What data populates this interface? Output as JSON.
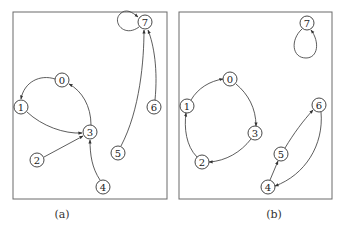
{
  "figure": {
    "node_radius": 7,
    "colors": {
      "stroke": "#333333",
      "frame": "#6a6a6a",
      "node_fill": "#ffffff"
    },
    "panels": [
      {
        "id": "a",
        "caption": "(a)",
        "caption_pos": [
          62,
          218
        ],
        "frame": {
          "x": 13,
          "y": 12,
          "w": 154,
          "h": 187
        },
        "nodes": [
          {
            "id": "0",
            "label": "0",
            "x": 62,
            "y": 80
          },
          {
            "id": "1",
            "label": "1",
            "x": 21,
            "y": 107
          },
          {
            "id": "2",
            "label": "2",
            "x": 37,
            "y": 160
          },
          {
            "id": "3",
            "label": "3",
            "x": 90,
            "y": 132
          },
          {
            "id": "4",
            "label": "4",
            "x": 103,
            "y": 187
          },
          {
            "id": "5",
            "label": "5",
            "x": 118,
            "y": 153
          },
          {
            "id": "6",
            "label": "6",
            "x": 154,
            "y": 107
          },
          {
            "id": "7",
            "label": "7",
            "x": 145,
            "y": 22
          }
        ],
        "edges": [
          {
            "from": "0",
            "to": "1",
            "path": "M55,79 C40,74 24,82 21,99"
          },
          {
            "from": "1",
            "to": "3",
            "path": "M27,112 C42,126 64,134 82,133"
          },
          {
            "from": "3",
            "to": "0",
            "path": "M91,125 C91,106 82,91 69,84"
          },
          {
            "from": "2",
            "to": "3",
            "path": "M44,157 L83,136"
          },
          {
            "from": "4",
            "to": "3",
            "path": "M100,180 C92,168 90,155 90,140"
          },
          {
            "from": "5",
            "to": "7",
            "path": "M121,146 C140,110 144,60 144,30"
          },
          {
            "from": "6",
            "to": "7",
            "path": "M155,100 C158,70 154,45 148,30"
          },
          {
            "from": "7",
            "to": "7",
            "path": "M139,27 C124,38 112,22 120,14 C126,8 132,12 138,17"
          }
        ]
      },
      {
        "id": "b",
        "caption": "(b)",
        "caption_pos": [
          274,
          218
        ],
        "frame": {
          "x": 179,
          "y": 12,
          "w": 153,
          "h": 187
        },
        "nodes": [
          {
            "id": "0",
            "label": "0",
            "x": 230,
            "y": 79
          },
          {
            "id": "1",
            "label": "1",
            "x": 187,
            "y": 106
          },
          {
            "id": "2",
            "label": "2",
            "x": 202,
            "y": 162
          },
          {
            "id": "3",
            "label": "3",
            "x": 255,
            "y": 133
          },
          {
            "id": "4",
            "label": "4",
            "x": 268,
            "y": 187
          },
          {
            "id": "5",
            "label": "5",
            "x": 281,
            "y": 154
          },
          {
            "id": "6",
            "label": "6",
            "x": 319,
            "y": 105
          },
          {
            "id": "7",
            "label": "7",
            "x": 307,
            "y": 23
          }
        ],
        "edges": [
          {
            "from": "1",
            "to": "0",
            "path": "M191,100 C198,88 210,81 223,79"
          },
          {
            "from": "0",
            "to": "3",
            "path": "M236,84 C248,94 256,108 256,126"
          },
          {
            "from": "3",
            "to": "2",
            "path": "M251,139 C241,152 226,161 209,162"
          },
          {
            "from": "2",
            "to": "1",
            "path": "M197,157 C186,146 184,128 186,113"
          },
          {
            "from": "4",
            "to": "5",
            "path": "M270,180 L278,161"
          },
          {
            "from": "5",
            "to": "6",
            "path": "M285,148 C294,133 303,121 313,110"
          },
          {
            "from": "6",
            "to": "4",
            "path": "M321,112 C324,145 305,175 275,186"
          },
          {
            "from": "7",
            "to": "7",
            "path": "M302,29 C290,40 292,58 306,58 C318,58 320,42 311,30"
          }
        ]
      }
    ]
  }
}
